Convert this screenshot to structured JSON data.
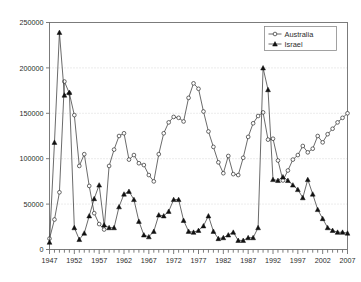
{
  "chart_data": {
    "type": "line",
    "title": "",
    "subtitle": "",
    "xlabel": "",
    "ylabel": "",
    "xlim": [
      1947,
      2007
    ],
    "ylim": [
      0,
      250000
    ],
    "grid": "horizontal-dotted",
    "legend_position": "top-right",
    "y_ticks": [
      0,
      50000,
      100000,
      150000,
      200000,
      250000
    ],
    "y_tick_labels": [
      "0",
      "50000",
      "100000",
      "150000",
      "200000",
      "250000"
    ],
    "x_tick_labels": [
      "1947",
      "1952",
      "1957",
      "1962",
      "1967",
      "1972",
      "1977",
      "1982",
      "1987",
      "1992",
      "1997",
      "2002",
      "2007"
    ],
    "x_tick_values": [
      1947,
      1952,
      1957,
      1962,
      1967,
      1972,
      1977,
      1982,
      1987,
      1992,
      1997,
      2002,
      2007
    ],
    "x_minor_tick_step": 1,
    "x": [
      1947,
      1948,
      1949,
      1950,
      1951,
      1952,
      1953,
      1954,
      1955,
      1956,
      1957,
      1958,
      1959,
      1960,
      1961,
      1962,
      1963,
      1964,
      1965,
      1966,
      1967,
      1968,
      1969,
      1970,
      1971,
      1972,
      1973,
      1974,
      1975,
      1976,
      1977,
      1978,
      1979,
      1980,
      1981,
      1982,
      1983,
      1984,
      1985,
      1986,
      1987,
      1988,
      1989,
      1990,
      1991,
      1992,
      1993,
      1994,
      1995,
      1996,
      1997,
      1998,
      1999,
      2000,
      2001,
      2002,
      2003,
      2004,
      2005,
      2006,
      2007
    ],
    "series": [
      {
        "name": "Australia",
        "marker": "open-circle",
        "values": [
          12000,
          33000,
          63000,
          185000,
          172000,
          148000,
          92000,
          105000,
          70000,
          40000,
          28000,
          22000,
          92000,
          110000,
          125000,
          128000,
          99000,
          104000,
          95000,
          93000,
          82000,
          75000,
          105000,
          128000,
          140000,
          146000,
          145000,
          141000,
          167000,
          183000,
          177000,
          152000,
          130000,
          113000,
          96000,
          84000,
          103000,
          83000,
          82000,
          101000,
          124000,
          139000,
          147000,
          151000,
          121000,
          122000,
          98000,
          76000,
          87000,
          99000,
          104000,
          114000,
          107000,
          111000,
          125000,
          118000,
          127000,
          133000,
          140000,
          145000,
          150000
        ]
      },
      {
        "name": "Israel",
        "marker": "filled-triangle",
        "values": [
          8000,
          118000,
          239000,
          170000,
          173000,
          24000,
          11000,
          18000,
          37000,
          56000,
          71000,
          27000,
          24000,
          24000,
          47000,
          61000,
          64000,
          55000,
          31000,
          16000,
          14000,
          20000,
          38000,
          37000,
          42000,
          55000,
          55000,
          32000,
          20000,
          19000,
          21000,
          26000,
          37000,
          20000,
          12000,
          13000,
          16000,
          19000,
          10000,
          10000,
          13000,
          13000,
          24000,
          200000,
          176000,
          77000,
          76000,
          80000,
          76000,
          71000,
          66000,
          57000,
          77000,
          61000,
          44000,
          34000,
          24000,
          21000,
          19000,
          19000,
          18000
        ]
      }
    ]
  },
  "legend": {
    "entries": [
      {
        "label": "Australia",
        "marker": "open-circle"
      },
      {
        "label": "Israel",
        "marker": "filled-triangle"
      }
    ]
  },
  "colors": {
    "series_line": "#3a3a3a",
    "frame": "#6e6e6e",
    "grid": "#c9c9c9",
    "text": "#2b2b2b",
    "background": "#ffffff"
  }
}
